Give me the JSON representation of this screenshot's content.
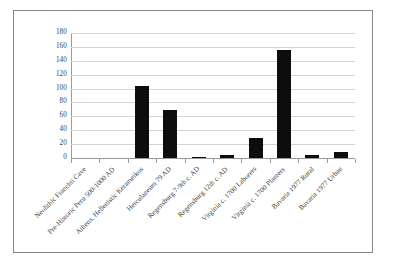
{
  "chart_data": {
    "type": "bar",
    "title": "",
    "subtitle": "",
    "xlabel": "",
    "ylabel": "",
    "ylim": [
      0,
      180
    ],
    "ytick_step": 20,
    "yticks": [
      "180",
      "160",
      "140",
      "120",
      "100",
      "80",
      "60",
      "40",
      "20",
      "0"
    ],
    "grid": "horizontal",
    "legend": "none",
    "bar_color": "#0d0d0d",
    "categories": [
      "Neolithic Franchti Cave",
      "Pre-Historic Peru 500-1000 AD",
      "Athens, Hellenistic Kerameikos",
      "Herculaneum 79 AD",
      "Regensburg 7-9th c. AD",
      "Regensburg 12th c. AD",
      "Virginia c. 1700 Laborers",
      "Virginia c. 1700 Planters",
      "Bavaria 1977 Rural",
      "Bavaria 1977 Urban"
    ],
    "values": [
      0,
      0,
      104,
      69,
      1,
      5,
      29,
      155,
      4,
      8
    ]
  }
}
